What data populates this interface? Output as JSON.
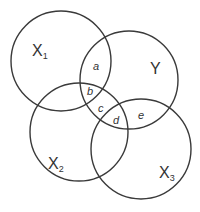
{
  "diagram": {
    "type": "venn",
    "stroke_color": "#3a3a3a",
    "sets": [
      {
        "id": "X1",
        "label": "X",
        "subscript": "1",
        "cx": 61,
        "cy": 61,
        "r": 50,
        "label_x": 32,
        "label_y": 56
      },
      {
        "id": "Y",
        "label": "Y",
        "subscript": "",
        "cx": 129,
        "cy": 80,
        "r": 49,
        "label_x": 150,
        "label_y": 74
      },
      {
        "id": "X2",
        "label": "X",
        "subscript": "2",
        "cx": 79,
        "cy": 132,
        "r": 49,
        "label_x": 48,
        "label_y": 169
      },
      {
        "id": "X3",
        "label": "X",
        "subscript": "3",
        "cx": 141,
        "cy": 149,
        "r": 50,
        "label_x": 159,
        "label_y": 178
      }
    ],
    "regions": [
      {
        "id": "a",
        "label": "a",
        "x": 93,
        "y": 70
      },
      {
        "id": "b",
        "label": "b",
        "x": 87,
        "y": 95
      },
      {
        "id": "c",
        "label": "c",
        "x": 98,
        "y": 112
      },
      {
        "id": "d",
        "label": "d",
        "x": 113,
        "y": 124
      },
      {
        "id": "e",
        "label": "e",
        "x": 138,
        "y": 119
      }
    ]
  }
}
